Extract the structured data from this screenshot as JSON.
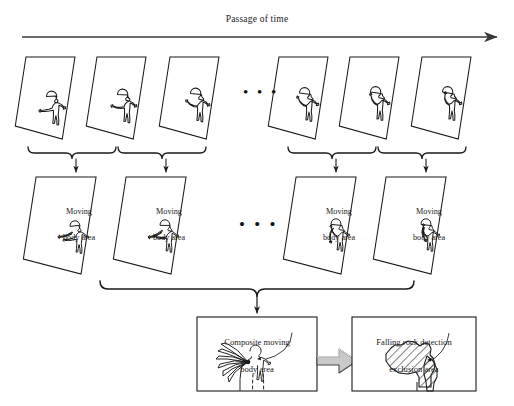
{
  "figure": {
    "type": "diagram",
    "timeline": {
      "label": "Passage of time",
      "arrow": "right-arrow",
      "x_start": 22,
      "x_end": 500,
      "y": 37
    },
    "ellipsis": "• • •",
    "row1": {
      "name": "captured frames",
      "frames": [
        {
          "id": "f1",
          "pose": "arms-down-left",
          "x": 24
        },
        {
          "id": "f2",
          "pose": "arm-raising-1",
          "x": 95
        },
        {
          "id": "f3",
          "pose": "arm-raising-2",
          "x": 168
        },
        {
          "id": "f4",
          "pose": "arm-raising-3",
          "x": 277
        },
        {
          "id": "f5",
          "pose": "arm-raising-4",
          "x": 348
        },
        {
          "id": "f6",
          "pose": "arm-up",
          "x": 420
        }
      ]
    },
    "row2": {
      "name": "moving body area frames",
      "label": "Moving\nbody area",
      "label_line1": "Moving",
      "label_line2": "body area",
      "frames": [
        {
          "id": "m1",
          "x": 50
        },
        {
          "id": "m2",
          "x": 140
        },
        {
          "id": "m3",
          "x": 310
        },
        {
          "id": "m4",
          "x": 400
        }
      ]
    },
    "row3": {
      "composite_box": {
        "label": "Composite moving\nbody area",
        "label_line1": "Composite moving",
        "label_line2": "body area",
        "x": 197,
        "y": 317,
        "w": 120,
        "h": 74
      },
      "transform_arrow": "block-arrow-right",
      "result_box": {
        "label": "Falling rock detection\nexclusion area",
        "label_line1": "Falling rock detection",
        "label_line2": "exclusion area",
        "x": 352,
        "y": 317,
        "w": 124,
        "h": 74,
        "fill": "diagonal-hatch"
      }
    },
    "colors": {
      "stroke": "#1a1a1a",
      "background": "#ffffff",
      "block_arrow_fill": "#c9c9c9",
      "block_arrow_stroke": "#4a4a4a"
    }
  }
}
